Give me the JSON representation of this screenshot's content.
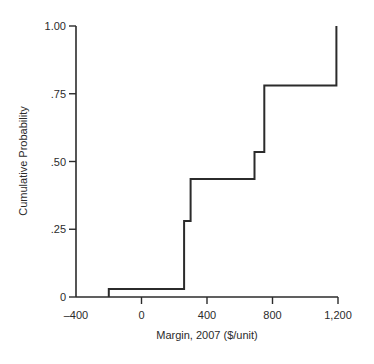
{
  "chart_data": {
    "type": "line",
    "subtype": "step",
    "title": "",
    "xlabel": "Margin, 2007 ($/unit)",
    "ylabel": "Cumulative Probability",
    "xlim": [
      -400,
      1200
    ],
    "ylim": [
      0,
      1.0
    ],
    "x_ticks": [
      -400,
      0,
      400,
      800,
      1200
    ],
    "x_tick_labels": [
      "–400",
      "0",
      "400",
      "800",
      "1,200"
    ],
    "y_ticks": [
      0,
      0.25,
      0.5,
      0.75,
      1.0
    ],
    "y_tick_labels": [
      "0",
      ".25",
      ".50",
      ".75",
      "1.00"
    ],
    "grid": false,
    "legend": null,
    "series": [
      {
        "name": "Cumulative distribution",
        "color": "#2b2b2b",
        "steps": [
          {
            "x": -200,
            "y_from": 0.0,
            "y_to": 0.03
          },
          {
            "x": 260,
            "y_from": 0.03,
            "y_to": 0.28
          },
          {
            "x": 300,
            "y_from": 0.28,
            "y_to": 0.435
          },
          {
            "x": 690,
            "y_from": 0.435,
            "y_to": 0.535
          },
          {
            "x": 750,
            "y_from": 0.535,
            "y_to": 0.78
          },
          {
            "x": 1190,
            "y_from": 0.78,
            "y_to": 1.0
          }
        ],
        "x": [
          -200,
          -200,
          260,
          260,
          300,
          300,
          690,
          690,
          750,
          750,
          1190,
          1190
        ],
        "y": [
          0,
          0.03,
          0.03,
          0.28,
          0.28,
          0.435,
          0.435,
          0.535,
          0.535,
          0.78,
          0.78,
          1.0
        ]
      }
    ]
  }
}
